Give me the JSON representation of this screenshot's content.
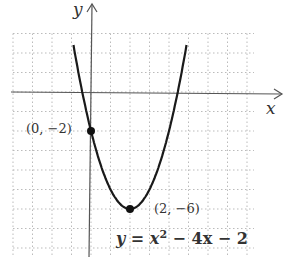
{
  "chart_data": {
    "type": "line",
    "title": "",
    "xlabel": "x",
    "ylabel": "y",
    "equation": "y = x^2 - 4x - 2",
    "equation_parts": {
      "lhs": "y",
      "eq": " = ",
      "x": "x",
      "sup": "2",
      "rest": " − 4x − 2"
    },
    "xlim": [
      -4,
      8.4
    ],
    "ylim": [
      -8,
      3
    ],
    "grid": true,
    "series": [
      {
        "name": "y = x^2 - 4x - 2",
        "x": [
          -0.9,
          -0.5,
          0,
          0.5,
          1,
          1.5,
          2,
          2.5,
          3,
          3.5,
          4,
          4.5,
          4.9
        ],
        "values": [
          2.41,
          0.25,
          -2,
          -3.75,
          -5,
          -5.75,
          -6,
          -5.75,
          -5,
          -3.75,
          -2,
          0.25,
          2.41
        ]
      }
    ],
    "points": [
      {
        "label": "(0, −2)",
        "x": 0,
        "y": -2
      },
      {
        "label": "(2, −6)",
        "x": 2,
        "y": -6
      }
    ]
  }
}
